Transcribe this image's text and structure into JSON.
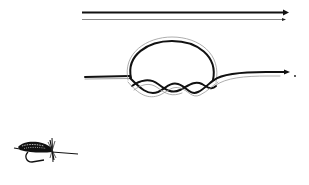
{
  "diagram": {
    "title": "",
    "colors": {
      "background": "#ffffff",
      "line_dark": "#111111",
      "line_light": "#8a8a8a"
    },
    "elements": [
      {
        "id": "straight-lines",
        "description": "two parallel lines with arrowheads pointing right"
      },
      {
        "id": "knot",
        "description": "loop knot with twisted wraps, line continuing to right with arrowhead"
      },
      {
        "id": "fly",
        "description": "dry fly lure with hook"
      }
    ]
  }
}
